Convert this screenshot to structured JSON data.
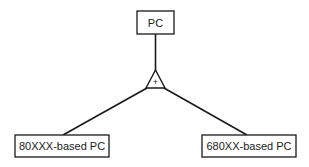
{
  "diagram": {
    "type": "generalization-hierarchy",
    "parent": {
      "label": "PC"
    },
    "generalization": {
      "symbol": "+",
      "shape": "triangle"
    },
    "children": [
      {
        "label": "80XXX-based PC"
      },
      {
        "label": "680XX-based PC"
      }
    ],
    "colors": {
      "stroke": "#1a1a1a",
      "background": "#ffffff"
    }
  }
}
